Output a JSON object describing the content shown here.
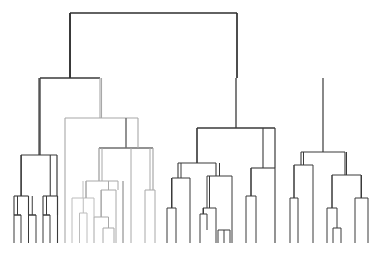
{
  "figure": {
    "kind": "dendrogram",
    "title": "",
    "background_color": "#ffffff",
    "width": 390,
    "height": 261,
    "baseline_y": 243,
    "leaf_start_x": 14,
    "leaf_spacing": 7.25,
    "leaf_count": 51,
    "orientation": "top-down",
    "axis_visible": false,
    "labels_visible": false
  },
  "colors": {
    "dark": "#3a3a3a",
    "root": "#2e2e2e",
    "medium": "#6e6e6e",
    "light": "#a8a8a8",
    "lighter": "#bcbcbc"
  },
  "chart_data": {
    "type": "dendrogram",
    "title": "",
    "xlabel": "",
    "ylabel": "",
    "grid": false,
    "legend": null,
    "leaf_count": 51,
    "merge_height_axis": "pixel-y (lower y = higher merge distance)",
    "nodes": [
      {
        "id": "root",
        "y": 13,
        "children": [
          "L",
          "R"
        ],
        "color": "#2e2e2e",
        "width": 1.6
      },
      {
        "id": "L",
        "y": 78,
        "children": [
          "L1",
          "L2"
        ],
        "color": "#3a3a3a",
        "width": 1.3
      },
      {
        "id": "L1",
        "y": 155,
        "children": [
          "L1a",
          "L1b"
        ],
        "color": "#3a3a3a",
        "width": 1.2
      },
      {
        "id": "L1a",
        "y": 196,
        "children": [
          "l0",
          "l1"
        ],
        "color": "#3a3a3a",
        "width": 1.1
      },
      {
        "id": "L1b",
        "y": 196,
        "children": [
          "l2",
          "l3"
        ],
        "color": "#3a3a3a",
        "width": 1.1
      },
      {
        "id": "l0",
        "y": 243,
        "leaf": true,
        "x": 14,
        "color": "#3a3a3a"
      },
      {
        "id": "l1",
        "y": 243,
        "leaf": true,
        "x": 28.5,
        "color": "#3a3a3a"
      },
      {
        "id": "l2",
        "y": 243,
        "leaf": true,
        "x": 43,
        "color": "#3a3a3a"
      },
      {
        "id": "l3",
        "y": 243,
        "leaf": true,
        "x": 57.5,
        "color": "#3a3a3a"
      },
      {
        "id": "L2",
        "y": 118,
        "children": [
          "L2a",
          "L2b"
        ],
        "color": "#a8a8a8",
        "width": 1.1
      },
      {
        "id": "L2a",
        "y": 181,
        "children": [
          "L2a1",
          "L2a2"
        ],
        "color": "#a8a8a8",
        "width": 1.0
      },
      {
        "id": "L2a1",
        "y": 198,
        "children": [
          "l4",
          "L2a1b"
        ],
        "color": "#bcbcbc",
        "width": 1.0
      },
      {
        "id": "L2a1b",
        "y": 213,
        "children": [
          "l5",
          "l6"
        ],
        "color": "#bcbcbc",
        "width": 1.0
      },
      {
        "id": "l4",
        "y": 243,
        "leaf": true,
        "x": 72,
        "color": "#a8a8a8"
      },
      {
        "id": "l5",
        "y": 243,
        "leaf": true,
        "x": 79.5,
        "color": "#bcbcbc"
      },
      {
        "id": "l6",
        "y": 243,
        "leaf": true,
        "x": 87,
        "color": "#bcbcbc"
      },
      {
        "id": "L2a2",
        "y": 190,
        "children": [
          "L2a2a",
          "l9"
        ],
        "color": "#a8a8a8",
        "width": 1.0
      },
      {
        "id": "L2a2a",
        "y": 217,
        "children": [
          "l7",
          "l8"
        ],
        "color": "#a8a8a8",
        "width": 1.0
      },
      {
        "id": "l7",
        "y": 243,
        "leaf": true,
        "x": 101,
        "color": "#a8a8a8"
      },
      {
        "id": "l8",
        "y": 228,
        "leaf": true,
        "x": 108.5,
        "color": "#a8a8a8"
      },
      {
        "id": "l9",
        "y": 243,
        "leaf": true,
        "x": 116,
        "color": "#a8a8a8"
      },
      {
        "id": "L2b",
        "y": 148,
        "children": [
          "L2a_link",
          "L2b2"
        ],
        "color": "#6e6e6e",
        "width": 1.4
      },
      {
        "id": "L2b2",
        "y": 190,
        "children": [
          "l10",
          "l11"
        ],
        "color": "#a8a8a8",
        "width": 1.0
      },
      {
        "id": "l10",
        "y": 243,
        "leaf": true,
        "x": 145,
        "color": "#a8a8a8"
      },
      {
        "id": "l11",
        "y": 243,
        "leaf": true,
        "x": 155,
        "color": "#a8a8a8"
      },
      {
        "id": "R",
        "y": 78,
        "children": [
          "R1",
          "R2"
        ],
        "color": "#3a3a3a",
        "width": 1.3
      },
      {
        "id": "R1",
        "y": 128,
        "children": [
          "R1a",
          "R1b"
        ],
        "color": "#3a3a3a",
        "width": 1.2
      },
      {
        "id": "R1a",
        "y": 163,
        "children": [
          "R1a1",
          "R1a2"
        ],
        "color": "#3a3a3a",
        "width": 1.1
      },
      {
        "id": "R1a1",
        "y": 178,
        "children": [
          "R1a1a",
          "l14"
        ],
        "color": "#3a3a3a",
        "width": 1.0
      },
      {
        "id": "R1a1a",
        "y": 208,
        "children": [
          "l12",
          "l13"
        ],
        "color": "#3a3a3a",
        "width": 1.0
      },
      {
        "id": "l12",
        "y": 243,
        "leaf": true,
        "x": 167,
        "color": "#3a3a3a"
      },
      {
        "id": "l13",
        "y": 243,
        "leaf": true,
        "x": 176,
        "color": "#3a3a3a"
      },
      {
        "id": "l14",
        "y": 243,
        "leaf": true,
        "x": 190,
        "color": "#3a3a3a"
      },
      {
        "id": "R1a2",
        "y": 176,
        "children": [
          "R1a2a",
          "l19"
        ],
        "color": "#3a3a3a",
        "width": 1.0
      },
      {
        "id": "R1a2a",
        "y": 208,
        "children": [
          "R1a2a1",
          "l17"
        ],
        "color": "#3a3a3a",
        "width": 1.0
      },
      {
        "id": "R1a2a1",
        "y": 214,
        "children": [
          "l15",
          "l16"
        ],
        "color": "#3a3a3a",
        "width": 1.0
      },
      {
        "id": "l15",
        "y": 243,
        "leaf": true,
        "x": 200,
        "color": "#3a3a3a"
      },
      {
        "id": "l16",
        "y": 230,
        "leaf": true,
        "x": 207,
        "color": "#3a3a3a"
      },
      {
        "id": "l17",
        "y": 243,
        "leaf": true,
        "x": 216,
        "color": "#3a3a3a"
      },
      {
        "id": "l19",
        "y": 243,
        "leaf": true,
        "x": 232,
        "color": "#3a3a3a"
      },
      {
        "id": "R1b",
        "y": 168,
        "children": [
          "R1b1",
          "l22"
        ],
        "color": "#3a3a3a",
        "width": 1.1
      },
      {
        "id": "R1b1",
        "y": 196,
        "children": [
          "l20",
          "l21"
        ],
        "color": "#3a3a3a",
        "width": 1.0
      },
      {
        "id": "l20",
        "y": 243,
        "leaf": true,
        "x": 246,
        "color": "#3a3a3a"
      },
      {
        "id": "l21",
        "y": 243,
        "leaf": true,
        "x": 256,
        "color": "#3a3a3a"
      },
      {
        "id": "l22",
        "y": 243,
        "leaf": true,
        "x": 275,
        "color": "#3a3a3a"
      },
      {
        "id": "R2",
        "y": 152,
        "children": [
          "R2a",
          "R2b"
        ],
        "color": "#3a3a3a",
        "width": 1.2
      },
      {
        "id": "R2a",
        "y": 165,
        "children": [
          "R2a1",
          "l26"
        ],
        "color": "#3a3a3a",
        "width": 1.0
      },
      {
        "id": "R2a1",
        "y": 198,
        "children": [
          "l23",
          "l24"
        ],
        "color": "#3a3a3a",
        "width": 1.0
      },
      {
        "id": "l23",
        "y": 243,
        "leaf": true,
        "x": 290,
        "color": "#3a3a3a"
      },
      {
        "id": "l24",
        "y": 243,
        "leaf": true,
        "x": 298,
        "color": "#3a3a3a"
      },
      {
        "id": "l26",
        "y": 243,
        "leaf": true,
        "x": 313,
        "color": "#3a3a3a"
      },
      {
        "id": "R2b",
        "y": 175,
        "children": [
          "R2b1",
          "R2b2"
        ],
        "color": "#3a3a3a",
        "width": 1.0
      },
      {
        "id": "R2b1",
        "y": 208,
        "children": [
          "l27",
          "l28"
        ],
        "color": "#3a3a3a",
        "width": 1.0
      },
      {
        "id": "l27",
        "y": 243,
        "leaf": true,
        "x": 327,
        "color": "#3a3a3a"
      },
      {
        "id": "l28",
        "y": 228,
        "leaf": true,
        "x": 337,
        "color": "#3a3a3a"
      },
      {
        "id": "R2b2",
        "y": 198,
        "children": [
          "l29",
          "l30"
        ],
        "color": "#3a3a3a",
        "width": 1.0
      },
      {
        "id": "l29",
        "y": 243,
        "leaf": true,
        "x": 355,
        "color": "#3a3a3a"
      },
      {
        "id": "l30",
        "y": 243,
        "leaf": true,
        "x": 368,
        "color": "#3a3a3a"
      }
    ],
    "baseline_leaves": [
      {
        "x": 14,
        "y_top": 196,
        "color": "#3a3a3a"
      },
      {
        "x": 21,
        "y_top": 215,
        "color": "#3a3a3a"
      },
      {
        "x": 28.5,
        "y_top": 196,
        "color": "#3a3a3a"
      },
      {
        "x": 36,
        "y_top": 215,
        "color": "#3a3a3a"
      },
      {
        "x": 43,
        "y_top": 196,
        "color": "#3a3a3a"
      },
      {
        "x": 50,
        "y_top": 215,
        "color": "#3a3a3a"
      },
      {
        "x": 57.5,
        "y_top": 215,
        "color": "#3a3a3a"
      },
      {
        "x": 65,
        "y_top": 118,
        "color": "#a8a8a8"
      },
      {
        "x": 72,
        "y_top": 198,
        "color": "#a8a8a8"
      },
      {
        "x": 79.5,
        "y_top": 213,
        "color": "#bcbcbc"
      },
      {
        "x": 87,
        "y_top": 213,
        "color": "#bcbcbc"
      },
      {
        "x": 94,
        "y_top": 217,
        "color": "#a8a8a8"
      },
      {
        "x": 101,
        "y_top": 217,
        "color": "#a8a8a8"
      },
      {
        "x": 108.5,
        "y_top": 228,
        "color": "#a8a8a8"
      },
      {
        "x": 116,
        "y_top": 190,
        "color": "#a8a8a8"
      },
      {
        "x": 123,
        "y_top": 181,
        "color": "#a8a8a8"
      },
      {
        "x": 131,
        "y_top": 148,
        "color": "#a8a8a8"
      },
      {
        "x": 138,
        "y_top": 148,
        "color": "#a8a8a8"
      },
      {
        "x": 145,
        "y_top": 190,
        "color": "#a8a8a8"
      },
      {
        "x": 155,
        "y_top": 190,
        "color": "#a8a8a8"
      }
    ]
  },
  "links": [
    {
      "name": "root-join",
      "x1": 70,
      "x2": 237,
      "y": 13,
      "color": "#2e2e2e",
      "w": 1.7
    },
    {
      "name": "root-stem-left",
      "x1": 70,
      "x2": 70,
      "y1": 13,
      "y2": 78,
      "color": "#2e2e2e",
      "w": 1.7
    },
    {
      "name": "root-stem-right",
      "x1": 237,
      "x2": 237,
      "y1": 13,
      "y2": 78,
      "color": "#2e2e2e",
      "w": 1.7
    }
  ]
}
